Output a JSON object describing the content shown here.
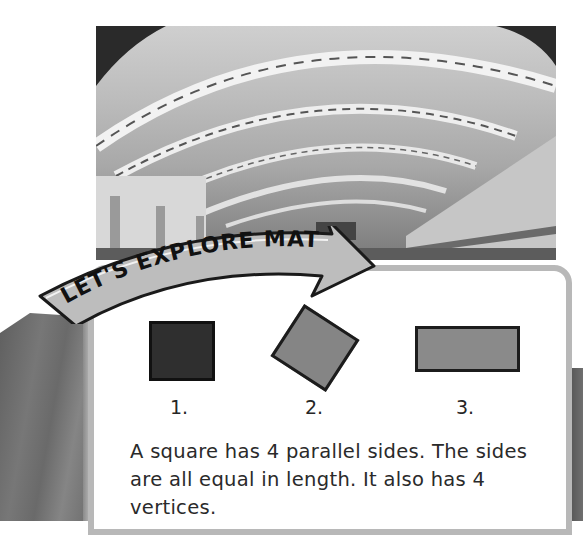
{
  "photo": {
    "subject": "airport terminal interior with arched skylight ceiling"
  },
  "banner": {
    "title": "LET'S EXPLORE MATH",
    "fill": "#bdbdbd",
    "text_color": "#111111"
  },
  "shapes": [
    {
      "label": "1.",
      "type": "square",
      "fill": "#2f2f2f"
    },
    {
      "label": "2.",
      "type": "rotated-square",
      "fill": "#858585"
    },
    {
      "label": "3.",
      "type": "rectangle",
      "fill": "#8a8a8a"
    }
  ],
  "body": {
    "text": "A square has 4 parallel sides. The sides are all equal in length. It also has 4 vertices."
  },
  "colors": {
    "card_border": "#b8b8b8",
    "panel_dark": "#666666",
    "text": "#2a2a2a"
  }
}
